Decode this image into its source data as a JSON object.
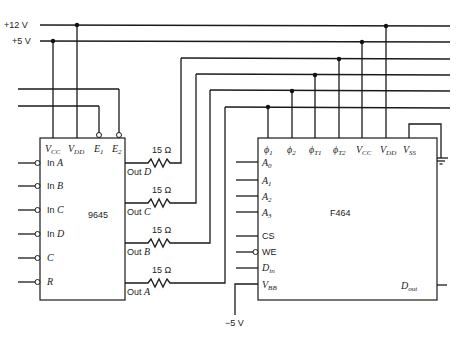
{
  "rails": {
    "plus12": "+12 V",
    "plus5": "+5 V",
    "minus5": "−5 V"
  },
  "chip_9645": {
    "name": "9645",
    "top_pins": [
      "V",
      "V",
      "E",
      "E"
    ],
    "top_pin_subs": [
      "CC",
      "DD",
      "1",
      "2"
    ],
    "inputs": [
      {
        "prefix": "In ",
        "letter": "A"
      },
      {
        "prefix": "In ",
        "letter": "B"
      },
      {
        "prefix": "In ",
        "letter": "C"
      },
      {
        "prefix": "In ",
        "letter": "D"
      },
      {
        "prefix": "",
        "letter": "C"
      },
      {
        "prefix": "",
        "letter": "R"
      }
    ],
    "outputs": [
      {
        "prefix": "Out ",
        "letter": "D"
      },
      {
        "prefix": "Out ",
        "letter": "C"
      },
      {
        "prefix": "Out ",
        "letter": "B"
      },
      {
        "prefix": "Out ",
        "letter": "A"
      }
    ]
  },
  "resistors": {
    "value": "15 Ω",
    "count": 4
  },
  "chip_F464": {
    "name": "F464",
    "top_pins": [
      {
        "main": "ϕ",
        "sub": "1"
      },
      {
        "main": "ϕ",
        "sub": "2"
      },
      {
        "main": "ϕ",
        "sub": "T1"
      },
      {
        "main": "ϕ",
        "sub": "T2"
      },
      {
        "main": "V",
        "sub": "CC"
      },
      {
        "main": "V",
        "sub": "DD"
      },
      {
        "main": "V",
        "sub": "SS"
      }
    ],
    "left_pins": [
      {
        "main": "A",
        "sub": "0",
        "italic": true
      },
      {
        "main": "A",
        "sub": "1",
        "italic": true
      },
      {
        "main": "A",
        "sub": "2",
        "italic": true
      },
      {
        "main": "A",
        "sub": "3",
        "italic": true
      },
      {
        "main": "CS",
        "sub": "",
        "italic": false
      },
      {
        "main": "WE",
        "sub": "",
        "italic": false
      },
      {
        "main": "D",
        "sub": "in",
        "italic": true
      },
      {
        "main": "V",
        "sub": "BB",
        "italic": true
      }
    ],
    "right_pins": [
      {
        "main": "D",
        "sub": "out"
      }
    ]
  },
  "ground": "ground-symbol"
}
